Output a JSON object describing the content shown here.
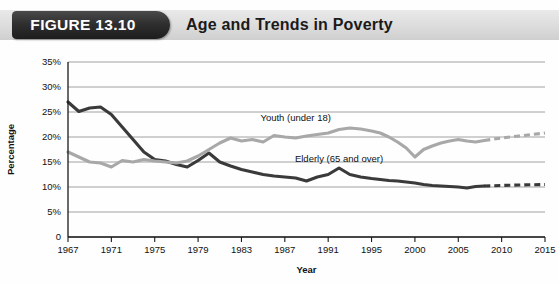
{
  "header": {
    "badge_label": "FIGURE 13.10",
    "title": "Age and Trends in Poverty",
    "badge_color": "#2e2e2e",
    "band_color": "#dcdcdc"
  },
  "chart_data": {
    "type": "line",
    "title": "Age and Trends in Poverty",
    "xlabel": "Year",
    "ylabel": "Percentage",
    "grid": true,
    "legend": "inline-labels",
    "ylim": [
      0,
      35
    ],
    "yticks": [
      0,
      5,
      10,
      15,
      20,
      25,
      30,
      35
    ],
    "ytick_labels": [
      "0",
      "5%",
      "10%",
      "15%",
      "20%",
      "25%",
      "30%",
      "35%"
    ],
    "xticks": [
      1967,
      1971,
      1975,
      1979,
      1983,
      1987,
      1991,
      1995,
      2000,
      2005,
      2010,
      2015
    ],
    "xtick_labels": [
      "1967",
      "1971",
      "1975",
      "1979",
      "1983",
      "1987",
      "1991",
      "1995",
      "2000",
      "2005",
      "2010",
      "2015"
    ],
    "xlim": [
      1967,
      2015
    ],
    "series": [
      {
        "name": "Elderly (65 and over)",
        "color": "#3a3a3a",
        "label_text": "Elderly (65 and over)",
        "x": [
          1967,
          1968,
          1969,
          1970,
          1971,
          1972,
          1973,
          1974,
          1975,
          1976,
          1977,
          1978,
          1979,
          1980,
          1981,
          1982,
          1983,
          1984,
          1985,
          1986,
          1987,
          1988,
          1989,
          1990,
          1991,
          1992,
          1993,
          1994,
          1995,
          1996,
          1997,
          1998,
          1999,
          2000,
          2001,
          2002,
          2003,
          2004,
          2005,
          2006,
          2007,
          2008
        ],
        "values": [
          27.0,
          25.1,
          25.8,
          26.0,
          24.5,
          22.0,
          19.5,
          17.0,
          15.5,
          15.2,
          14.5,
          14.0,
          15.3,
          16.8,
          15.0,
          14.2,
          13.5,
          13.0,
          12.5,
          12.2,
          12.0,
          11.8,
          11.2,
          12.0,
          12.5,
          13.8,
          12.5,
          12.0,
          11.7,
          11.5,
          11.3,
          11.2,
          11.0,
          10.8,
          10.5,
          10.3,
          10.2,
          10.1,
          10.0,
          9.8,
          10.1,
          10.2
        ],
        "projection_x": [
          2008,
          2010,
          2012,
          2015
        ],
        "projection_values": [
          10.2,
          10.3,
          10.4,
          10.5
        ],
        "label_x": 1992,
        "label_y": 15.0
      },
      {
        "name": "Youth (under 18)",
        "color": "#a8a8a8",
        "label_text": "Youth (under 18)",
        "x": [
          1967,
          1968,
          1969,
          1970,
          1971,
          1972,
          1973,
          1974,
          1975,
          1976,
          1977,
          1978,
          1979,
          1980,
          1981,
          1982,
          1983,
          1984,
          1985,
          1986,
          1987,
          1988,
          1989,
          1990,
          1991,
          1992,
          1993,
          1994,
          1995,
          1996,
          1997,
          1998,
          1999,
          2000,
          2001,
          2002,
          2003,
          2004,
          2005,
          2006,
          2007,
          2008
        ],
        "values": [
          17.0,
          16.0,
          15.0,
          14.8,
          14.0,
          15.3,
          15.0,
          15.5,
          15.2,
          15.0,
          14.8,
          15.2,
          16.2,
          17.5,
          18.8,
          19.8,
          19.2,
          19.5,
          19.0,
          20.3,
          20.0,
          19.8,
          20.2,
          20.5,
          20.8,
          21.5,
          21.8,
          21.6,
          21.2,
          20.8,
          20.0,
          19.0,
          17.8,
          16.0,
          17.5,
          18.2,
          18.8,
          19.2,
          19.5,
          19.2,
          19.0,
          19.3
        ],
        "projection_x": [
          2008,
          2010,
          2012,
          2015
        ],
        "projection_values": [
          19.3,
          19.8,
          20.2,
          20.8
        ],
        "label_x": 1988,
        "label_y": 23.2
      }
    ]
  }
}
